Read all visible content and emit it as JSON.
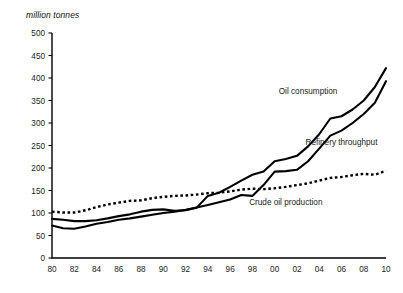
{
  "chart_data": {
    "type": "line",
    "title": "",
    "subtitle": "",
    "xlabel": "",
    "ylabel": "million tonnes",
    "ylim": [
      0,
      500
    ],
    "ytick_step": 50,
    "yticks": [
      "500",
      "450",
      "400",
      "350",
      "300",
      "250",
      "200",
      "150",
      "100",
      "50",
      "0"
    ],
    "grid": false,
    "legend_position": "inline-annotations",
    "x": [
      1980,
      1981,
      1982,
      1983,
      1984,
      1985,
      1986,
      1987,
      1988,
      1989,
      1990,
      1991,
      1992,
      1993,
      1994,
      1995,
      1996,
      1997,
      1998,
      1999,
      2000,
      2001,
      2002,
      2003,
      2004,
      2005,
      2006,
      2007,
      2008,
      2009,
      2010
    ],
    "xticks": [
      "80",
      "82",
      "84",
      "86",
      "88",
      "90",
      "92",
      "94",
      "96",
      "98",
      "00",
      "02",
      "04",
      "06",
      "08",
      "10"
    ],
    "xtick_values": [
      1980,
      1982,
      1984,
      1986,
      1988,
      1990,
      1992,
      1994,
      1996,
      1998,
      2000,
      2002,
      2004,
      2006,
      2008,
      2010
    ],
    "series": [
      {
        "name": "Oil consumption",
        "style": "solid",
        "color": "#000000",
        "label_x": 2003,
        "label_y": 365,
        "values": [
          87,
          85,
          82,
          82,
          84,
          88,
          93,
          97,
          103,
          107,
          108,
          105,
          106,
          112,
          138,
          145,
          158,
          172,
          185,
          192,
          215,
          220,
          227,
          248,
          275,
          310,
          315,
          330,
          350,
          380,
          422
        ]
      },
      {
        "name": "Refinery throughput",
        "style": "solid",
        "color": "#000000",
        "label_x": 2006,
        "label_y": 252,
        "values": [
          72,
          66,
          65,
          70,
          76,
          80,
          85,
          88,
          92,
          96,
          100,
          103,
          107,
          112,
          118,
          124,
          130,
          140,
          138,
          162,
          192,
          193,
          196,
          215,
          243,
          272,
          283,
          300,
          320,
          345,
          393
        ]
      },
      {
        "name": "Crude oil production",
        "style": "dotted",
        "color": "#000000",
        "label_x": 2001,
        "label_y": 118,
        "values": [
          103,
          101,
          101,
          106,
          113,
          119,
          123,
          127,
          128,
          133,
          136,
          138,
          139,
          141,
          144,
          145,
          148,
          152,
          154,
          153,
          155,
          158,
          162,
          166,
          172,
          178,
          180,
          184,
          187,
          185,
          194
        ]
      }
    ]
  }
}
